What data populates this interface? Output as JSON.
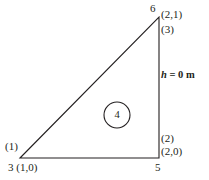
{
  "figure": {
    "type": "finite-element-triangle-diagram",
    "background_color": "#ffffff",
    "line_color": "#231f20",
    "nodes": [
      {
        "id": "node-6",
        "number": "6",
        "coord_label": "(2,1)",
        "x": 159,
        "y": 17
      },
      {
        "id": "node-3",
        "number": "3",
        "coord_label": "(1,0)",
        "x": 20,
        "y": 158
      },
      {
        "id": "node-5",
        "number": "5",
        "coord_label": "(2,0)",
        "x": 159,
        "y": 158
      }
    ],
    "node_labels": {
      "top_number": "6",
      "top_coord": "(2,1)",
      "bottom_left_combined": "3 (1,0)",
      "bottom_right_number": "5",
      "bottom_right_coord": "(2,0)"
    },
    "edge_labels": {
      "edge_1": "(1)",
      "edge_2": "(2)",
      "edge_3": "(3)"
    },
    "element_label": "4",
    "boundary_condition": {
      "symbol": "h",
      "equals": "=",
      "value": "0",
      "unit": "m",
      "full": "h = 0 m"
    }
  }
}
